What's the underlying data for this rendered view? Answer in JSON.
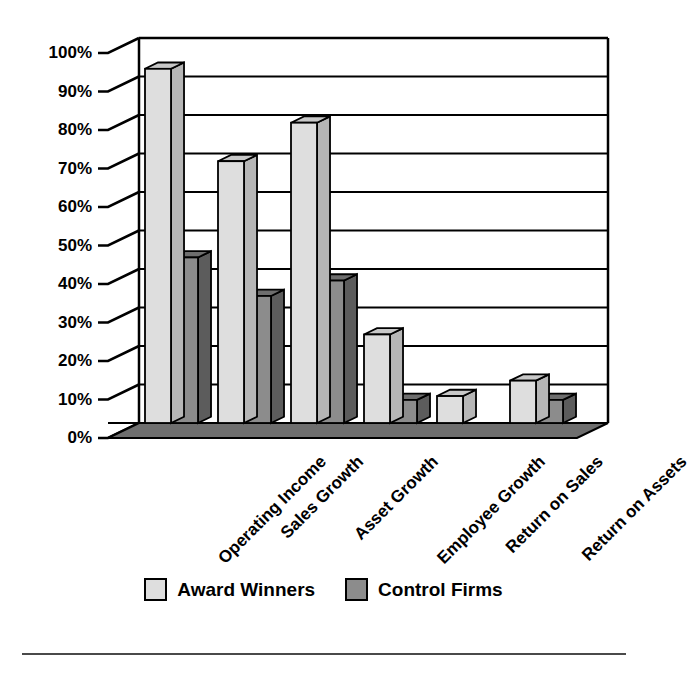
{
  "chart_data": {
    "type": "bar",
    "title": "",
    "subtitle": "",
    "xlabel": "",
    "ylabel": "",
    "ylim": [
      0,
      100
    ],
    "y_unit": "%",
    "grid": true,
    "legend_position": "bottom",
    "style": "3d-clustered-bar",
    "categories": [
      "Operating Income",
      "Sales Growth",
      "Asset Growth",
      "Employee Growth",
      "Return on Sales",
      "Return on Assets"
    ],
    "ytick_labels": [
      "0%",
      "10%",
      "20%",
      "30%",
      "40%",
      "50%",
      "60%",
      "70%",
      "80%",
      "90%",
      "100%"
    ],
    "ytick_values": [
      0,
      10,
      20,
      30,
      40,
      50,
      60,
      70,
      80,
      90,
      100
    ],
    "series": [
      {
        "name": "Award Winners",
        "color": "#dedede",
        "side_color": "#b6b6b6",
        "top_color": "#c8c8c8",
        "values": [
          92,
          68,
          78,
          23,
          7,
          11
        ]
      },
      {
        "name": "Control Firms",
        "color": "#8c8c8c",
        "side_color": "#5c5c5c",
        "top_color": "#6e6e6e",
        "values": [
          43,
          33,
          37,
          6,
          0,
          6
        ]
      }
    ]
  },
  "legend": {
    "items": [
      {
        "label": "Award Winners",
        "swatch": "award"
      },
      {
        "label": "Control Firms",
        "swatch": "control"
      }
    ]
  },
  "colors": {
    "axis": "#000000",
    "gridline": "#000000",
    "floor": "#6e6e6e",
    "background": "#ffffff",
    "rule": "#4a4a4a"
  }
}
